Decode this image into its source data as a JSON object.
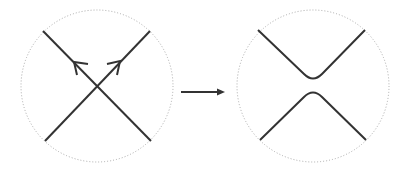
{
  "diagram": {
    "colors": {
      "stroke": "#333333",
      "circle": "#aaaaaa",
      "background": "#ffffff"
    },
    "left_panel": {
      "label": "",
      "kind": "oriented crossing",
      "arrow_directions": [
        "up-left",
        "up-right"
      ]
    },
    "transition_arrow": {
      "label": ""
    },
    "right_panel": {
      "label": "",
      "kind": "oriented smoothing"
    }
  }
}
